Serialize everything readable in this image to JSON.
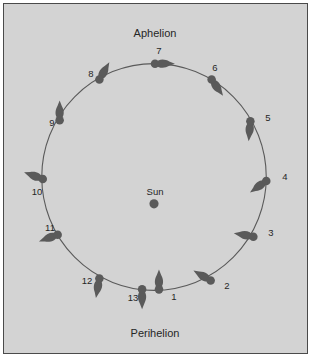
{
  "figure": {
    "type": "orbit-diagram",
    "background_color": "#d3d3d3",
    "border_color": "#4a4a4a",
    "mark_color": "#5a5a5a",
    "orbit_color": "#5a5a5a",
    "center_label": "Sun",
    "top_label": "Aphelion",
    "bottom_label": "Perihelion"
  },
  "chart_data": {
    "type": "scatter",
    "title": "",
    "xlabel": "",
    "ylabel": "",
    "annotations": [
      "Aphelion",
      "Perihelion",
      "Sun"
    ],
    "sun": {
      "label": "Sun",
      "x": 155,
      "y": 205
    },
    "orbit": {
      "cx": 155,
      "cy": 178,
      "rx": 113,
      "ry": 114
    },
    "positions": [
      {
        "label": "1",
        "x": 160,
        "y": 291,
        "arrow_deg": -90,
        "label_dx": 10,
        "label_dy": 7
      },
      {
        "label": "2",
        "x": 212,
        "y": 282,
        "arrow_deg": -150,
        "label_dx": 11,
        "label_dy": 5
      },
      {
        "label": "3",
        "x": 255,
        "y": 238,
        "arrow_deg": -170,
        "label_dx": 12,
        "label_dy": -4
      },
      {
        "label": "4",
        "x": 268,
        "y": 182,
        "arrow_deg": 145,
        "label_dx": 13,
        "label_dy": -4
      },
      {
        "label": "5",
        "x": 252,
        "y": 122,
        "arrow_deg": 95,
        "label_dx": 12,
        "label_dy": -3
      },
      {
        "label": "6",
        "x": 213,
        "y": 80,
        "arrow_deg": 55,
        "label_dx": -2,
        "label_dy": -11
      },
      {
        "label": "7",
        "x": 156,
        "y": 64,
        "arrow_deg": 0,
        "label_dx": -1,
        "label_dy": -12
      },
      {
        "label": "8",
        "x": 100,
        "y": 80,
        "arrow_deg": -60,
        "label_dx": -13,
        "label_dy": -5
      },
      {
        "label": "9",
        "x": 60,
        "y": 121,
        "arrow_deg": -90,
        "label_dx": -12,
        "label_dy": 3
      },
      {
        "label": "10",
        "x": 43,
        "y": 180,
        "arrow_deg": -160,
        "label_dx": -10,
        "label_dy": 13
      },
      {
        "label": "11",
        "x": 58,
        "y": 236,
        "arrow_deg": 160,
        "label_dx": -12,
        "label_dy": -7
      },
      {
        "label": "12",
        "x": 100,
        "y": 280,
        "arrow_deg": 100,
        "label_dx": -17,
        "label_dy": 2
      },
      {
        "label": "13",
        "x": 143,
        "y": 291,
        "arrow_deg": 90,
        "label_dx": -14,
        "label_dy": 8
      }
    ]
  }
}
